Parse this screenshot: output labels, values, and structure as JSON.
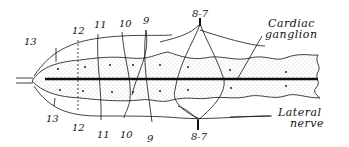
{
  "diagram": {
    "type": "anatomical-line-drawing",
    "colors": {
      "ink": "#111111",
      "stipple": "#9a9a9a",
      "background": "#ffffff"
    },
    "top_labels": [
      {
        "id": "n13",
        "text": "13",
        "x": 27,
        "y": 44
      },
      {
        "id": "n12",
        "text": "12",
        "x": 74,
        "y": 35
      },
      {
        "id": "n11",
        "text": "11",
        "x": 93,
        "y": 28
      },
      {
        "id": "n10",
        "text": "10",
        "x": 119,
        "y": 27
      },
      {
        "id": "n9",
        "text": "9",
        "x": 145,
        "y": 24
      },
      {
        "id": "n8_7",
        "text": "8-7",
        "x": 200,
        "y": 18
      }
    ],
    "bottom_labels": [
      {
        "id": "n13b",
        "text": "13",
        "x": 48,
        "y": 119
      },
      {
        "id": "n12b",
        "text": "12",
        "x": 75,
        "y": 129
      },
      {
        "id": "n11b",
        "text": "11",
        "x": 101,
        "y": 136
      },
      {
        "id": "n10b",
        "text": "10",
        "x": 124,
        "y": 136
      },
      {
        "id": "n9b",
        "text": "9",
        "x": 150,
        "y": 141
      },
      {
        "id": "n8_7b",
        "text": "8-7",
        "x": 201,
        "y": 136
      }
    ],
    "callouts": [
      {
        "id": "cardiac-ganglion",
        "lines": [
          "Cardiac",
          "ganglion"
        ],
        "x": 268,
        "y": 26
      },
      {
        "id": "lateral-nerve",
        "lines": [
          "Lateral",
          "nerve"
        ],
        "x": 278,
        "y": 115
      }
    ]
  }
}
